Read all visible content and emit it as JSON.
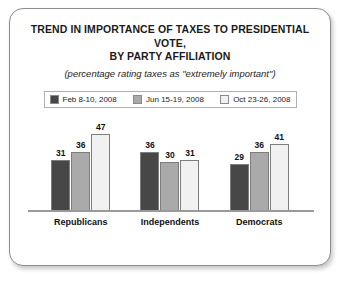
{
  "chart_data": {
    "type": "bar",
    "title": "TREND IN IMPORTANCE OF TAXES TO PRESIDENTIAL VOTE, BY PARTY AFFILIATION",
    "title_lines": [
      "TREND IN IMPORTANCE OF TAXES TO PRESIDENTIAL VOTE,",
      "BY PARTY AFFILIATION"
    ],
    "subtitle": "(percentage rating taxes as \"extremely important\")",
    "categories": [
      "Republicans",
      "Independents",
      "Democrats"
    ],
    "series": [
      {
        "name": "Feb 8-10, 2008",
        "values": [
          31,
          36,
          29
        ],
        "color": "#474747"
      },
      {
        "name": "Jun 15-19, 2008",
        "values": [
          36,
          30,
          36
        ],
        "color": "#aaaaaa"
      },
      {
        "name": "Oct 23-26, 2008",
        "values": [
          47,
          31,
          41
        ],
        "color": "#f1f1f1"
      }
    ],
    "xlabel": "",
    "ylabel": "",
    "ylim": [
      0,
      60
    ],
    "grid": false,
    "legend_position": "top",
    "data_labels": true,
    "axis_color": "#9a9a9a",
    "frame_color": "#8d8d8d"
  }
}
